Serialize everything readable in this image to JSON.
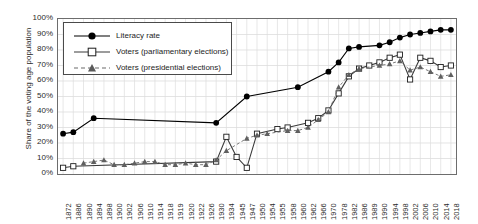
{
  "chart_data": {
    "type": "line",
    "title": "",
    "xlabel": "",
    "ylabel": "Share of the voting age population",
    "ylim": [
      0,
      100
    ],
    "ytick_labels": [
      "100%",
      "90%",
      "80%",
      "70%",
      "60%",
      "50%",
      "40%",
      "30%",
      "20%",
      "10%",
      "0%"
    ],
    "ytick_values": [
      100,
      90,
      80,
      70,
      60,
      50,
      40,
      30,
      20,
      10,
      0
    ],
    "grid": true,
    "legend_position": "top-left",
    "categories": [
      "1872",
      "1886",
      "1890",
      "1894",
      "1898",
      "1900",
      "1902",
      "1906",
      "1910",
      "1914",
      "1918",
      "1919",
      "1920",
      "1922",
      "1926",
      "1930",
      "1934",
      "1945",
      "1947",
      "1950",
      "1954",
      "1955",
      "1958",
      "1960",
      "1962",
      "1966",
      "1970",
      "1978",
      "1982",
      "1986",
      "1989",
      "1990",
      "1994",
      "1998",
      "2002",
      "2006",
      "2010",
      "2014",
      "2018"
    ],
    "series": [
      {
        "name": "Literacy rate",
        "marker": "filled-circle",
        "line": "solid",
        "color": "#000000",
        "values": [
          26,
          27,
          null,
          36,
          null,
          null,
          null,
          null,
          null,
          null,
          null,
          null,
          null,
          null,
          null,
          33,
          null,
          null,
          50,
          null,
          null,
          null,
          null,
          56,
          null,
          null,
          66,
          72,
          81,
          82,
          null,
          83,
          85,
          88,
          90,
          91,
          92,
          93,
          93
        ]
      },
      {
        "name": "Voters (parliamentary elections)",
        "marker": "open-square",
        "line": "solid",
        "color": "#3a3a3a",
        "values": [
          4,
          5,
          null,
          null,
          null,
          null,
          null,
          null,
          null,
          null,
          null,
          null,
          null,
          null,
          null,
          8,
          24,
          11,
          4,
          26,
          null,
          29,
          30,
          null,
          33,
          36,
          41,
          52,
          63,
          68,
          70,
          72,
          75,
          77,
          61,
          75,
          73,
          69,
          70
        ]
      },
      {
        "name": "Voters (presidential elections)",
        "marker": "filled-triangle",
        "line": "dashed",
        "color": "#6a6a6a",
        "values": [
          null,
          null,
          7,
          8,
          9,
          6,
          6,
          7,
          8,
          8,
          6,
          6,
          7,
          6,
          6,
          9,
          15,
          null,
          23,
          25,
          26,
          null,
          28,
          28,
          30,
          35,
          40,
          56,
          64,
          68,
          null,
          70,
          71,
          73,
          67,
          69,
          66,
          63,
          64
        ]
      }
    ]
  },
  "legend": {
    "items": [
      {
        "label": "Literacy rate"
      },
      {
        "label": "Voters (parliamentary elections)"
      },
      {
        "label": "Voters (presidential elections)"
      }
    ]
  }
}
